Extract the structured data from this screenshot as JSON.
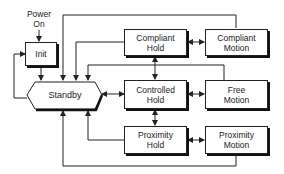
{
  "diagram": {
    "start": {
      "label_line1": "Power",
      "label_line2": "On"
    },
    "states": {
      "init": "Init",
      "standby": "Standby",
      "compliant_hold": {
        "line1": "Compliant",
        "line2": "Hold"
      },
      "compliant_motion": {
        "line1": "Compliant",
        "line2": "Motion"
      },
      "controlled_hold": {
        "line1": "Controlled",
        "line2": "Hold"
      },
      "free_motion": {
        "line1": "Free",
        "line2": "Motion"
      },
      "proximity_hold": {
        "line1": "Proximity",
        "line2": "Hold"
      },
      "proximity_motion": {
        "line1": "Proximity",
        "line2": "Motion"
      }
    },
    "transitions": [
      {
        "from": "Power On",
        "to": "Init"
      },
      {
        "from": "Init",
        "to": "Standby"
      },
      {
        "from": "Standby",
        "to": "Init"
      },
      {
        "from": "Standby",
        "to": "Controlled Hold",
        "bidirectional": true
      },
      {
        "from": "Compliant Hold",
        "to": "Compliant Motion",
        "bidirectional": true
      },
      {
        "from": "Controlled Hold",
        "to": "Free Motion",
        "bidirectional": true
      },
      {
        "from": "Proximity Hold",
        "to": "Proximity Motion",
        "bidirectional": true
      },
      {
        "from": "Compliant Hold",
        "to": "Controlled Hold",
        "bidirectional": true
      },
      {
        "from": "Controlled Hold",
        "to": "Proximity Hold",
        "bidirectional": true
      },
      {
        "from": "Compliant Motion",
        "to": "Standby"
      },
      {
        "from": "Compliant Hold",
        "to": "Standby"
      },
      {
        "from": "Free Motion",
        "to": "Standby"
      },
      {
        "from": "Proximity Hold",
        "to": "Standby"
      },
      {
        "from": "Proximity Motion",
        "to": "Standby"
      }
    ]
  }
}
